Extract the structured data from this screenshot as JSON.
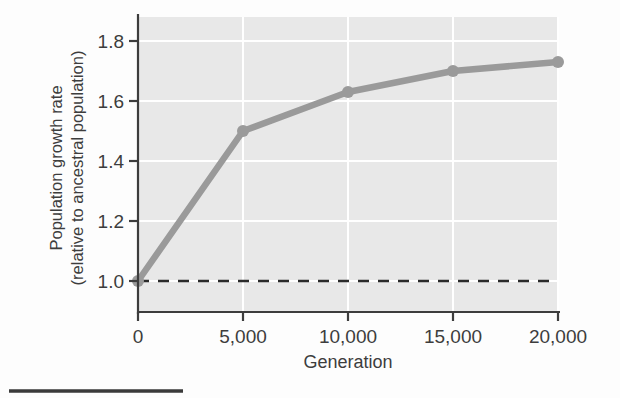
{
  "figure": {
    "background_color": "#fdfdfd",
    "plot_background_color": "#e8e8e8",
    "grid_color": "#ffffff",
    "axis_color": "#3d3d3d",
    "series_color": "#9a9a9a",
    "reference_line_color": "#2b2b2b",
    "footer_rule_color": "#3a3a3a"
  },
  "chart_data": {
    "type": "line",
    "title": "",
    "subtitle": "",
    "xlabel": "Generation",
    "ylabel": "Population growth rate\n(relative to ancestral population)",
    "ylabel_line1": "Population growth rate",
    "ylabel_line2": "(relative to ancestral population)",
    "x": [
      0,
      5000,
      10000,
      15000,
      20000
    ],
    "values": [
      1.0,
      1.5,
      1.63,
      1.7,
      1.73
    ],
    "series": [
      {
        "name": "Population growth rate",
        "color": "#9a9a9a",
        "marker": "circle",
        "values": [
          1.0,
          1.5,
          1.63,
          1.7,
          1.73
        ]
      }
    ],
    "xlim": [
      0,
      20000
    ],
    "ylim": [
      0.9,
      1.88
    ],
    "xticks": [
      0,
      5000,
      10000,
      15000,
      20000
    ],
    "xticklabels": [
      "0",
      "5,000",
      "10,000",
      "15,000",
      "20,000"
    ],
    "yticks": [
      1.0,
      1.2,
      1.4,
      1.6,
      1.8
    ],
    "yticklabels": [
      "1.0",
      "1.2",
      "1.4",
      "1.6",
      "1.8"
    ],
    "grid": true,
    "grid_axis": "both",
    "legend": false,
    "legend_position": "none",
    "annotations": [
      {
        "name": "ancestral-baseline",
        "type": "horizontal-reference-line",
        "y": 1.0,
        "style": "dashed",
        "label": ""
      }
    ]
  }
}
